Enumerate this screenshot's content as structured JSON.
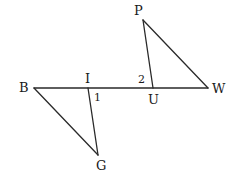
{
  "diagram": {
    "type": "geometry",
    "points": {
      "B": {
        "label": "B",
        "x": 34,
        "y": 88
      },
      "I": {
        "label": "I",
        "x": 88,
        "y": 88
      },
      "G": {
        "label": "G",
        "x": 98,
        "y": 155
      },
      "U": {
        "label": "U",
        "x": 153,
        "y": 88
      },
      "P": {
        "label": "P",
        "x": 143,
        "y": 20
      },
      "W": {
        "label": "W",
        "x": 208,
        "y": 88
      }
    },
    "angle_labels": {
      "angle1": "1",
      "angle2": "2"
    },
    "segments": [
      [
        "B",
        "W"
      ],
      [
        "B",
        "G"
      ],
      [
        "I",
        "G"
      ],
      [
        "P",
        "U"
      ],
      [
        "P",
        "W"
      ]
    ]
  }
}
